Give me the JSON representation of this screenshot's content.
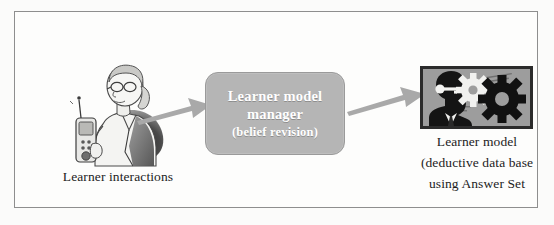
{
  "figure": {
    "type": "process-flow-diagram",
    "background_color": "#fbfbfa",
    "border_color": "#8e8e8e"
  },
  "left_stage": {
    "icon_name": "learner-person-with-handheld-device",
    "caption": "Learner interactions"
  },
  "center_stage": {
    "box_color": "#b5b5b5",
    "text_color": "#ffffff",
    "line1": "Learner model",
    "line2": "manager",
    "line3": "(belief revision)"
  },
  "right_stage": {
    "icon_name": "head-silhouette-with-gears",
    "image_border_color": "#2b2b2b",
    "image_background_color": "#9d9d9d",
    "caption_line1": "Learner model",
    "caption_line2": "(deductive data base",
    "caption_line3": "using Answer Set"
  },
  "arrows": {
    "color": "#a9a9a9",
    "left_arrow_name": "arrow-learner-to-manager",
    "right_arrow_name": "arrow-manager-to-model"
  }
}
